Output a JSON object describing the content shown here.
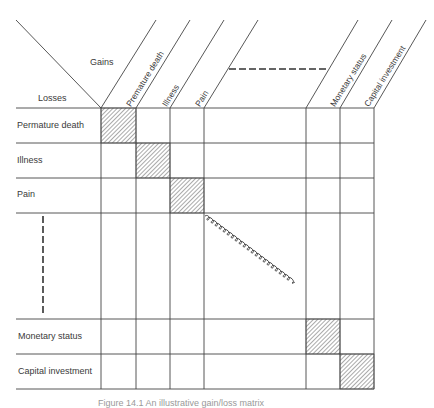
{
  "header": {
    "gains_label": "Gains",
    "losses_label": "Losses"
  },
  "columns": [
    {
      "label": "Premature death"
    },
    {
      "label": "Illness"
    },
    {
      "label": "Pain"
    },
    {
      "label": ""
    },
    {
      "label": "Monetary status"
    },
    {
      "label": "Capital investment"
    }
  ],
  "rows": [
    {
      "label": "Permature death"
    },
    {
      "label": "Illness"
    },
    {
      "label": "Pain"
    },
    {
      "label": ""
    },
    {
      "label": "Monetary status"
    },
    {
      "label": "Capital investment"
    }
  ],
  "diagonal_cells": "hatched",
  "ellipsis_markers": {
    "header": "dashed-horizontal",
    "rows": "dashed-vertical",
    "diagonal": "coil"
  },
  "caption": "Figure 14.1  An illustrative gain/loss matrix"
}
